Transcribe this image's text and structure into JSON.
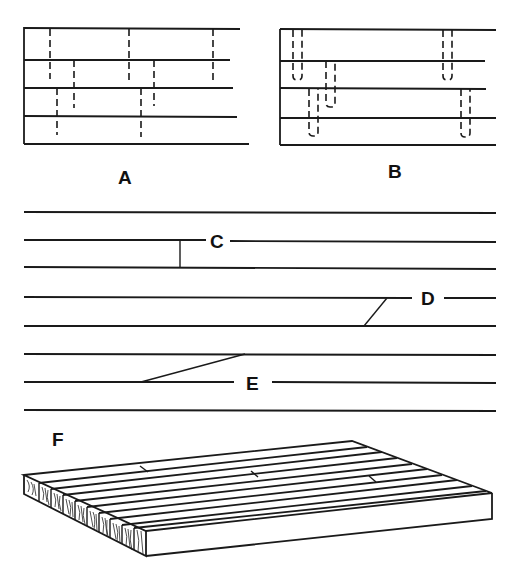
{
  "figure": {
    "colors": {
      "ink": "#1a1a1a",
      "background": "#ffffff"
    },
    "panels": [
      {
        "id": "A",
        "label": "A",
        "description": "Staggered butt joints (dashed) across strips"
      },
      {
        "id": "B",
        "label": "B",
        "description": "Staggered dowelled/slotted joints shown as U-shaped hidden lines"
      },
      {
        "id": "C",
        "label": "C",
        "description": "Square butt joint between two strips"
      },
      {
        "id": "D",
        "label": "D",
        "description": "Short angled scarf joint"
      },
      {
        "id": "E",
        "label": "E",
        "description": "Long scarf joint"
      },
      {
        "id": "F",
        "label": "F",
        "description": "Isometric view of finished butcher-block slab with end grain visible"
      }
    ]
  },
  "labels": {
    "a": "A",
    "b": "B",
    "c": "C",
    "d": "D",
    "e": "E",
    "f": "F"
  }
}
